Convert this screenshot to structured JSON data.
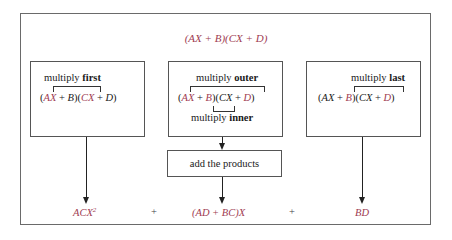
{
  "diagram": {
    "title": {
      "expression": "(AX + B)(CX + D)",
      "color": "#a03c52"
    },
    "boxes": [
      {
        "id": "first",
        "label_prefix": "multiply",
        "label_bold": "first",
        "expr_parts": [
          "(",
          "AX",
          " + B)(",
          "CX",
          " + D)"
        ],
        "highlighted_terms": [
          "AX",
          "CX"
        ]
      },
      {
        "id": "outer-inner",
        "label_prefix": "multiply",
        "label_bold": "outer",
        "expr_parts": [
          "(",
          "AX",
          " + ",
          "B",
          ")(",
          "CX",
          " + ",
          "D",
          ")"
        ],
        "highlighted_terms": [
          "AX",
          "B",
          "D"
        ],
        "sub_label_prefix": "multiply",
        "sub_label_bold": "inner"
      },
      {
        "id": "last",
        "label_prefix": "multiply",
        "label_bold": "last",
        "expr_parts": [
          "(AX + ",
          "B",
          ")(CX + ",
          "D",
          ")"
        ],
        "highlighted_terms": [
          "B",
          "D"
        ]
      }
    ],
    "add_box": {
      "label": "add the products"
    },
    "results": {
      "first": "ACX",
      "first_exponent": "2",
      "plus1": "+",
      "middle": "(AD + BC)X",
      "plus2": "+",
      "last": "BD"
    },
    "colors": {
      "highlight": "#a03c52",
      "line": "#222222",
      "border": "#555555"
    }
  }
}
